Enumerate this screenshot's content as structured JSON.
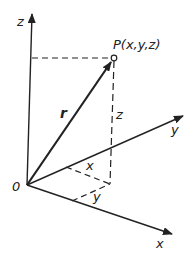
{
  "diagram": {
    "colors": {
      "line": "#222222",
      "background": "#ffffff"
    },
    "labels": {
      "z_axis": "z",
      "y_axis": "y",
      "x_axis": "x",
      "origin": "0",
      "point": "P(x,y,z)",
      "vector": "r",
      "z_component": "z",
      "x_component": "x",
      "y_component": "y"
    },
    "geometry": {
      "origin": [
        27,
        185
      ],
      "z_axis_tip": [
        32,
        13
      ],
      "y_axis_tip": [
        183,
        116
      ],
      "x_axis_tip": [
        172,
        234
      ],
      "point_P": [
        114,
        58
      ],
      "foot_point": [
        110,
        184
      ]
    }
  }
}
